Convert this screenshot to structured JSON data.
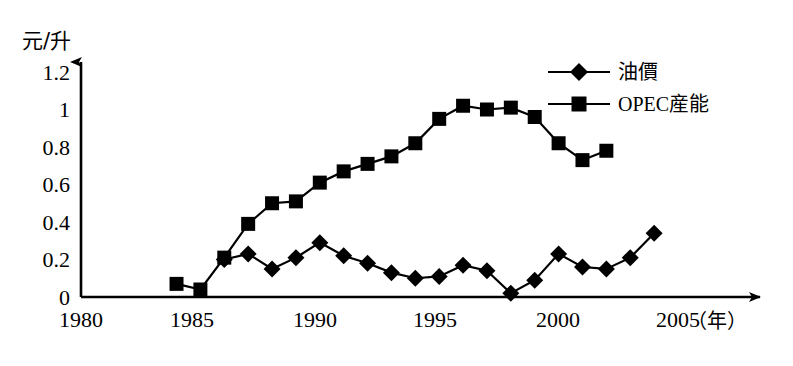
{
  "chart_data": {
    "type": "line",
    "title": "",
    "subtitle": "",
    "xlabel": "（年）",
    "ylabel": "元/升",
    "xlim": [
      1980,
      2006.5
    ],
    "ylim": [
      0,
      1.3
    ],
    "grid": false,
    "legend_position": "top-right",
    "x_ticks": [
      "1980",
      "1985",
      "1990",
      "1995",
      "2000",
      "2005"
    ],
    "x_tick_values": [
      1980,
      1985,
      1990,
      1995,
      2000,
      2005
    ],
    "y_ticks": [
      "0",
      "0.2",
      "0.4",
      "0.6",
      "0.8",
      "1",
      "1.2"
    ],
    "y_tick_values": [
      0,
      0.2,
      0.4,
      0.6,
      0.8,
      1.0,
      1.2
    ],
    "series": [
      {
        "name": "油價",
        "marker": "diamond",
        "color": "#000000",
        "x": [
          1986,
          1987,
          1988,
          1989,
          1990,
          1991,
          1992,
          1993,
          1994,
          1995,
          1996,
          1997,
          1998,
          1999,
          2000,
          2001,
          2002,
          2003,
          2004
        ],
        "values": [
          0.2,
          0.23,
          0.15,
          0.21,
          0.29,
          0.22,
          0.18,
          0.13,
          0.1,
          0.11,
          0.17,
          0.14,
          0.02,
          0.09,
          0.23,
          0.16,
          0.15,
          0.21,
          0.34
        ]
      },
      {
        "name": "OPEC産能",
        "marker": "square",
        "color": "#000000",
        "x": [
          1984,
          1985,
          1986,
          1987,
          1988,
          1989,
          1990,
          1991,
          1992,
          1993,
          1994,
          1995,
          1996,
          1997,
          1998,
          1999,
          2000,
          2001,
          2002
        ],
        "values": [
          0.07,
          0.04,
          0.21,
          0.39,
          0.5,
          0.51,
          0.61,
          0.67,
          0.71,
          0.75,
          0.82,
          0.95,
          1.02,
          1.0,
          1.01,
          0.96,
          0.82,
          0.73,
          0.78
        ]
      }
    ]
  },
  "legend": {
    "entries": [
      {
        "label": "油價",
        "marker": "diamond"
      },
      {
        "label": "OPEC産能",
        "marker": "square"
      }
    ]
  }
}
